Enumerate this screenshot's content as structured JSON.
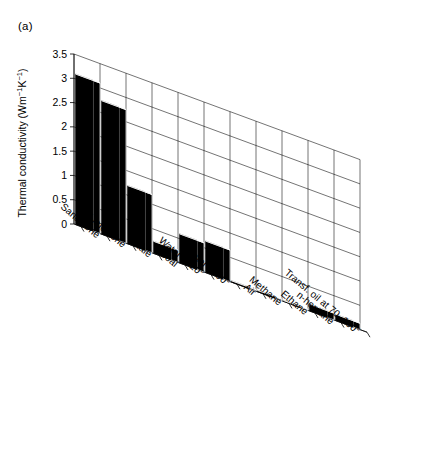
{
  "figure": {
    "panel_label": "(a)"
  },
  "chart_data": {
    "type": "bar",
    "title": "",
    "subtitle": "",
    "xlabel": "",
    "ylabel": "Thermal conductivity (Wm⁻¹K⁻¹)",
    "ylabel_parts": {
      "text": "Thermal conductivity (Wm",
      "sup1": "−1",
      "mid": "K",
      "sup2": "−1",
      "close": ")"
    },
    "categories": [
      "Sandstone",
      "Limestone",
      "Shale",
      "Coal",
      "Water at 20°",
      "Water at 90°",
      "Air",
      "Methane",
      "Ethane",
      "n-heptane",
      "Transf. oil at 70–100°"
    ],
    "values": [
      3.1,
      2.75,
      1.2,
      0.25,
      0.6,
      0.65,
      0.03,
      0.03,
      0.02,
      0.14,
      0.13
    ],
    "ylim": [
      0,
      3.5
    ],
    "yticks": [
      0,
      0.5,
      1,
      1.5,
      2,
      2.5,
      3,
      3.5
    ],
    "ytick_labels": [
      "0",
      "0.5",
      "1",
      "1.5",
      "2",
      "2.5",
      "3",
      "3.5"
    ],
    "grid": true,
    "legend": null,
    "projection": "3d-perspective",
    "bar_color": "#000000",
    "axis_color": "#000000",
    "grid_color": "#000000"
  }
}
